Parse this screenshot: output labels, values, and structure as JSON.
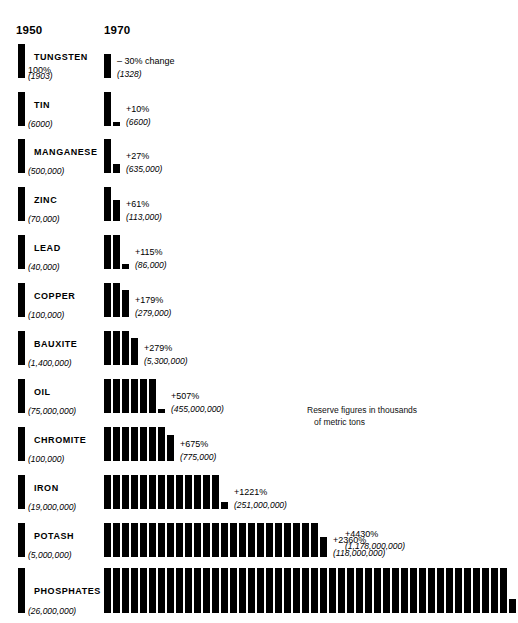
{
  "top_caption": "1970.",
  "headers": {
    "left": "1950",
    "right": "1970"
  },
  "footnote": {
    "line1": "Reserve figures in thousands",
    "line2": "of metric tons"
  },
  "phosphates_extra": {
    "percent": "+4430%",
    "reserve": "(1,178,000,000)"
  },
  "chart_data": {
    "type": "bar",
    "subtitle": "Reserve figures in thousands of metric tons",
    "xlabel": "",
    "ylabel": "",
    "grid": false,
    "legend": "none",
    "unit_note": "Each unit bar equals the 1950 reserve (100%); the 1970 row repeats that unit bar proportionally to the growth multiple.",
    "categories": [
      "TUNGSTEN",
      "TIN",
      "MANGANESE",
      "ZINC",
      "LEAD",
      "COPPER",
      "BAUXITE",
      "OIL",
      "CHROMITE",
      "IRON",
      "POTASH",
      "PHOSPHATES"
    ],
    "series": [
      {
        "name": "1950",
        "values": [
          1903,
          6000,
          500000,
          70000,
          40000,
          100000,
          1400000,
          75000000,
          100000,
          19000000,
          5000000,
          26000000
        ]
      },
      {
        "name": "1970",
        "values": [
          1328,
          6600,
          635000,
          113000,
          86000,
          279000,
          5300000,
          455000000,
          775000,
          251000000,
          118000000,
          1178000000
        ]
      }
    ],
    "percent_change": [
      -30,
      10,
      27,
      61,
      115,
      179,
      279,
      507,
      675,
      1221,
      2360,
      4430
    ],
    "multiple_of_1950": [
      0.7,
      1.1,
      1.27,
      1.61,
      2.15,
      2.79,
      3.79,
      6.07,
      7.75,
      13.21,
      24.6,
      45.31
    ]
  },
  "rows": [
    {
      "name": "TUNGSTEN",
      "pct_1950": "100%",
      "reserve_1950": "(1903)",
      "pct_1970": "– 30% change",
      "reserve_1970": "(1328)"
    },
    {
      "name": "TIN",
      "pct_1950": "",
      "reserve_1950": "(6000)",
      "pct_1970": "+10%",
      "reserve_1970": "(6600)"
    },
    {
      "name": "MANGANESE",
      "pct_1950": "",
      "reserve_1950": "(500,000)",
      "pct_1970": "+27%",
      "reserve_1970": "(635,000)"
    },
    {
      "name": "ZINC",
      "pct_1950": "",
      "reserve_1950": "(70,000)",
      "pct_1970": "+61%",
      "reserve_1970": "(113,000)"
    },
    {
      "name": "LEAD",
      "pct_1950": "",
      "reserve_1950": "(40,000)",
      "pct_1970": "+115%",
      "reserve_1970": "(86,000)"
    },
    {
      "name": "COPPER",
      "pct_1950": "",
      "reserve_1950": "(100,000)",
      "pct_1970": "+179%",
      "reserve_1970": "(279,000)"
    },
    {
      "name": "BAUXITE",
      "pct_1950": "",
      "reserve_1950": "(1,400,000)",
      "pct_1970": "+279%",
      "reserve_1970": "(5,300,000)"
    },
    {
      "name": "OIL",
      "pct_1950": "",
      "reserve_1950": "(75,000,000)",
      "pct_1970": "+507%",
      "reserve_1970": "(455,000,000)"
    },
    {
      "name": "CHROMITE",
      "pct_1950": "",
      "reserve_1950": "(100,000)",
      "pct_1970": "+675%",
      "reserve_1970": "(775,000)"
    },
    {
      "name": "IRON",
      "pct_1950": "",
      "reserve_1950": "(19,000,000)",
      "pct_1970": "+1221%",
      "reserve_1970": "(251,000,000)"
    },
    {
      "name": "POTASH",
      "pct_1950": "",
      "reserve_1950": "(5,000,000)",
      "pct_1970": "+2360%",
      "reserve_1970": "(118,000,000)"
    },
    {
      "name": "PHOSPHATES",
      "pct_1950": "",
      "reserve_1950": "(26,000,000)",
      "pct_1970": "",
      "reserve_1970": ""
    }
  ]
}
